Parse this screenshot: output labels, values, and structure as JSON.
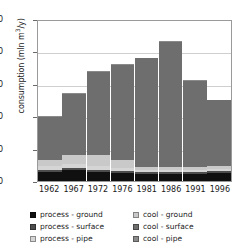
{
  "chart_data": {
    "type": "bar",
    "title": "",
    "subtitle": "",
    "xlabel": "",
    "ylabel": "consumption (mln m3/y)",
    "ylabel_parts": {
      "pre": "consumption (mln m",
      "sup": "3",
      "post": "/y)"
    },
    "ylim": [
      0,
      5000
    ],
    "yticks": [
      0,
      1000,
      2000,
      3000,
      4000,
      5000
    ],
    "ytick_labels": [
      "0",
      "1,000",
      "2,000",
      "3,000",
      "4,000",
      "5,000"
    ],
    "grid": true,
    "grid_axis": "y",
    "stacked": true,
    "legend_position": "bottom",
    "legend_columns": 2,
    "categories": [
      "1962",
      "1967",
      "1972",
      "1976",
      "1981",
      "1986",
      "1991",
      "1996"
    ],
    "series": [
      {
        "name": "process - ground",
        "color": "#101010",
        "values": [
          290,
          350,
          270,
          250,
          230,
          220,
          225,
          250
        ]
      },
      {
        "name": "process - surface",
        "color": "#4d4d4d",
        "values": [
          60,
          60,
          70,
          60,
          55,
          50,
          50,
          50
        ]
      },
      {
        "name": "process - pipe",
        "color": "#d5d5d5",
        "values": [
          120,
          110,
          120,
          100,
          70,
          60,
          60,
          60
        ]
      },
      {
        "name": "cool - ground",
        "color": "#c9c9c9",
        "values": [
          180,
          270,
          350,
          250,
          90,
          90,
          90,
          95
        ]
      },
      {
        "name": "cool - surface",
        "color": "#6e6e6e",
        "values": [
          1330,
          1910,
          2570,
          2930,
          3345,
          3880,
          2675,
          2035
        ]
      },
      {
        "name": "cool - pipe",
        "color": "#8a8a8a",
        "values": [
          20,
          20,
          20,
          20,
          20,
          20,
          20,
          20
        ]
      }
    ],
    "totals": [
      2000,
      2720,
      3400,
      3610,
      3810,
      4320,
      3120,
      2510
    ]
  },
  "legend": {
    "items": [
      {
        "label": "process - ground"
      },
      {
        "label": "process - surface"
      },
      {
        "label": "process - pipe"
      },
      {
        "label": "cool - ground"
      },
      {
        "label": "cool - surface"
      },
      {
        "label": "cool - pipe"
      }
    ]
  }
}
